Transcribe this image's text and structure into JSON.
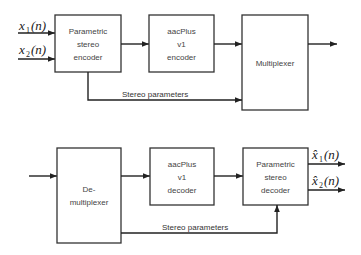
{
  "encoder": {
    "inputs": [
      {
        "symbol": "x",
        "subscript": "1",
        "arg": "(n)"
      },
      {
        "symbol": "x",
        "subscript": "2",
        "arg": "(n)"
      }
    ],
    "blocks": {
      "ps_encoder": [
        "Parametric",
        "stereo",
        "encoder"
      ],
      "aac_encoder": [
        "aacPlus",
        "v1",
        "encoder"
      ],
      "multiplexer": [
        "Multiplexer"
      ]
    },
    "side_path_label": "Stereo parameters"
  },
  "decoder": {
    "outputs": [
      {
        "symbol": "x̂",
        "subscript": "1",
        "arg": "(n)"
      },
      {
        "symbol": "x̂",
        "subscript": "2",
        "arg": "(n)"
      }
    ],
    "blocks": {
      "demultiplexer": [
        "De-",
        "multiplexer"
      ],
      "aac_decoder": [
        "aacPlus",
        "v1",
        "decoder"
      ],
      "ps_decoder": [
        "Parametric",
        "stereo",
        "decoder"
      ]
    },
    "side_path_label": "Stereo parameters"
  }
}
